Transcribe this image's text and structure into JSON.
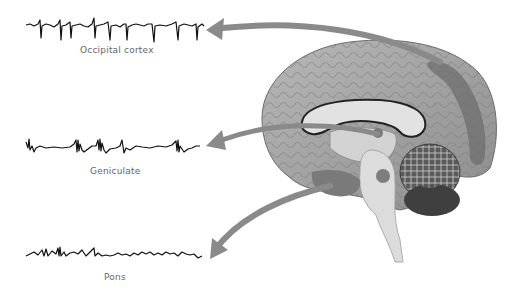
{
  "figure": {
    "traces": [
      {
        "id": "occipital",
        "label": "Occipital cortex",
        "pattern": "regular sharp spikes"
      },
      {
        "id": "geniculate",
        "label": "Geniculate",
        "pattern": "bursts of spikes (PGO waves)"
      },
      {
        "id": "pons",
        "label": "Pons",
        "pattern": "irregular low-amplitude activity with bursts"
      }
    ],
    "brain": {
      "view": "midsagittal section",
      "highlighted_regions": [
        "occipital cortex",
        "lateral geniculate",
        "pons"
      ]
    },
    "colors": {
      "trace": "#111111",
      "arrow": "#8a8a8a",
      "brain_cortex": "#9a9a9a",
      "highlight": "#6e6e6e",
      "label": "#666666"
    }
  }
}
